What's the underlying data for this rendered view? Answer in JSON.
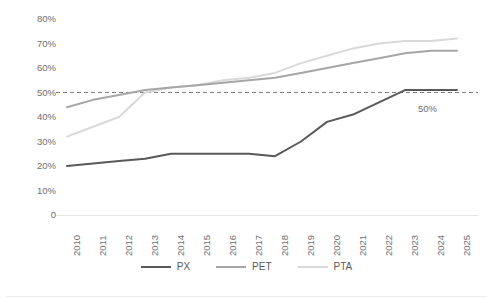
{
  "chart_data": {
    "type": "line",
    "title": "",
    "subtitle": "",
    "xlabel": "",
    "ylabel": "",
    "categories": [
      "2010",
      "2011",
      "2012",
      "2013",
      "2014",
      "2015",
      "2016",
      "2017",
      "2018",
      "2019",
      "2020",
      "2021",
      "2022",
      "2023",
      "2024",
      "2025"
    ],
    "ylim": [
      0,
      80
    ],
    "ytick_labels": [
      "80%",
      "70%",
      "60%",
      "50%",
      "40%",
      "30%",
      "20%",
      "10%",
      "0"
    ],
    "ytick_values": [
      80,
      70,
      60,
      50,
      40,
      30,
      20,
      10,
      0
    ],
    "grid": false,
    "legend_position": "bottom",
    "series": [
      {
        "name": "PX",
        "color": "#595959",
        "values": [
          20,
          21,
          22,
          23,
          25,
          25,
          25,
          25,
          24,
          30,
          38,
          41,
          46,
          51,
          51,
          51
        ]
      },
      {
        "name": "PET",
        "color": "#a6a6a6",
        "values": [
          44,
          47,
          49,
          51,
          52,
          53,
          54,
          55,
          56,
          58,
          60,
          62,
          64,
          66,
          67,
          67
        ]
      },
      {
        "name": "PTA",
        "color": "#d9d9d9",
        "values": [
          32,
          36,
          40,
          50,
          52,
          53,
          55,
          56,
          58,
          62,
          65,
          68,
          70,
          71,
          71,
          72
        ]
      }
    ],
    "annotations": [
      {
        "name": "reference-line-50",
        "type": "hline",
        "value": 50,
        "label": "50%",
        "style": "dashed",
        "color": "#7f7f7f"
      }
    ]
  },
  "legend": {
    "items": [
      {
        "label": "PX",
        "color": "#595959"
      },
      {
        "label": "PET",
        "color": "#a6a6a6"
      },
      {
        "label": "PTA",
        "color": "#d9d9d9"
      }
    ]
  },
  "axis": {
    "y_labels": [
      "80%",
      "70%",
      "60%",
      "50%",
      "40%",
      "30%",
      "20%",
      "10%",
      "0"
    ],
    "x_labels": [
      "2010",
      "2011",
      "2012",
      "2013",
      "2014",
      "2015",
      "2016",
      "2017",
      "2018",
      "2019",
      "2020",
      "2021",
      "2022",
      "2023",
      "2024",
      "2025"
    ]
  },
  "reference_label": "50%"
}
